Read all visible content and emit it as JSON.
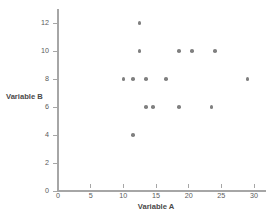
{
  "chart_data": {
    "type": "scatter",
    "title": "",
    "xlabel": "Variable A",
    "ylabel": "Variable B",
    "xlim": [
      0,
      31
    ],
    "ylim": [
      0,
      13
    ],
    "xticks": [
      0,
      5,
      10,
      15,
      20,
      25,
      30
    ],
    "yticks": [
      0,
      2,
      4,
      6,
      8,
      10,
      12
    ],
    "xtick_labels": [
      "0",
      "5",
      "10",
      "15",
      "20",
      "25",
      "30"
    ],
    "ytick_labels": [
      "0",
      "2",
      "4",
      "6",
      "8",
      "10",
      "12"
    ],
    "grid": false,
    "legend": null,
    "marker_color": "#808080",
    "axis_color": "#a6a6a6",
    "points": [
      {
        "x": 12.5,
        "y": 12
      },
      {
        "x": 12.5,
        "y": 10
      },
      {
        "x": 18.5,
        "y": 10
      },
      {
        "x": 20.5,
        "y": 10
      },
      {
        "x": 24.0,
        "y": 10
      },
      {
        "x": 10.0,
        "y": 8
      },
      {
        "x": 11.5,
        "y": 8
      },
      {
        "x": 13.5,
        "y": 8
      },
      {
        "x": 16.5,
        "y": 8
      },
      {
        "x": 29.0,
        "y": 8
      },
      {
        "x": 13.5,
        "y": 6
      },
      {
        "x": 14.5,
        "y": 6
      },
      {
        "x": 18.5,
        "y": 6
      },
      {
        "x": 23.5,
        "y": 6
      },
      {
        "x": 11.5,
        "y": 4
      }
    ]
  }
}
